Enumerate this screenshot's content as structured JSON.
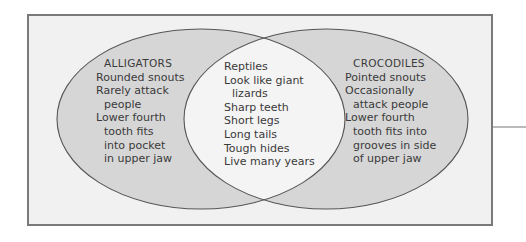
{
  "diagram": {
    "type": "venn",
    "colors": {
      "frame_border": "#7a7a7a",
      "frame_fill": "#f1f1f1",
      "circle_fill": "#d6d6d6",
      "overlap_fill": "#f4f4f4",
      "stroke": "#555555",
      "text": "#3a3a3a"
    },
    "left": {
      "title": "ALLIGATORS",
      "items": [
        "Rounded snouts",
        "Rarely attack",
        "people",
        "Lower fourth",
        "tooth fits",
        "into pocket",
        "in upper jaw"
      ]
    },
    "center": {
      "items": [
        "Reptiles",
        "Look like giant",
        "lizards",
        "Sharp teeth",
        "Short legs",
        "Long tails",
        "Tough hides",
        "Live many years"
      ]
    },
    "right": {
      "title": "CROCODILES",
      "items": [
        "Pointed snouts",
        "Occasionally",
        "attack people",
        "Lower fourth",
        "tooth fits into",
        "grooves in side",
        "of upper jaw"
      ]
    }
  }
}
